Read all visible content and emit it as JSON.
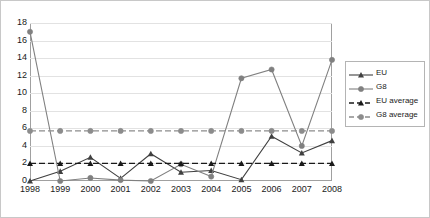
{
  "chart_data": {
    "type": "line",
    "title": "",
    "subtitle": "",
    "xlabel": "",
    "ylabel": "",
    "categories": [
      "1998",
      "1999",
      "2000",
      "2001",
      "2002",
      "2003",
      "2004",
      "2005",
      "2006",
      "2007",
      "2008"
    ],
    "ylim": [
      0,
      18
    ],
    "ytick_values": [
      0,
      2,
      4,
      6,
      8,
      10,
      12,
      14,
      16,
      18
    ],
    "ytick_labels": [
      "0",
      "2",
      "4",
      "6",
      "8",
      "10",
      "12",
      "14",
      "16",
      "18"
    ],
    "grid": true,
    "grid_axis": "y",
    "legend_position": "right",
    "series": [
      {
        "name": "EU",
        "style": "solid",
        "marker": "triangle",
        "color": "#404040",
        "values": [
          0.0,
          1.1,
          2.7,
          0.3,
          3.1,
          1.0,
          1.2,
          0.15,
          5.1,
          3.2,
          4.6
        ]
      },
      {
        "name": "G8",
        "style": "solid",
        "marker": "circle",
        "color": "#808080",
        "values": [
          17.0,
          0.0,
          0.35,
          0.1,
          0.0,
          1.9,
          0.5,
          11.7,
          12.7,
          4.0,
          13.8
        ]
      },
      {
        "name": "EU average",
        "style": "dashed",
        "marker": "triangle",
        "color": "#1a1a1a",
        "constant": 2.0,
        "values": [
          2.0,
          2.0,
          2.0,
          2.0,
          2.0,
          2.0,
          2.0,
          2.0,
          2.0,
          2.0,
          2.0
        ]
      },
      {
        "name": "G8 average",
        "style": "dashed",
        "marker": "circle",
        "color": "#8c8c8c",
        "constant": 5.7,
        "values": [
          5.7,
          5.7,
          5.7,
          5.7,
          5.7,
          5.7,
          5.7,
          5.7,
          5.7,
          5.7,
          5.7
        ]
      }
    ]
  },
  "legend": {
    "entries": [
      {
        "label": "EU"
      },
      {
        "label": "G8"
      },
      {
        "label": "EU average"
      },
      {
        "label": "G8 average"
      }
    ]
  }
}
